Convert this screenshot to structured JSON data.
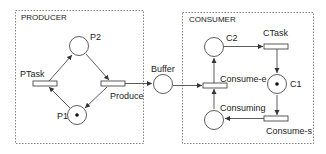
{
  "diagram": {
    "type": "petri-net",
    "groups": [
      {
        "id": "producer",
        "label": "PRODUCER"
      },
      {
        "id": "consumer",
        "label": "CONSUMER"
      }
    ],
    "places": [
      {
        "id": "P2",
        "label": "P2",
        "tokens": 0
      },
      {
        "id": "P1",
        "label": "P1",
        "tokens": 1
      },
      {
        "id": "Buffer",
        "label": "Buffer",
        "tokens": 0
      },
      {
        "id": "C2",
        "label": "C2",
        "tokens": 0
      },
      {
        "id": "C1",
        "label": "C1",
        "tokens": 1
      },
      {
        "id": "Consuming",
        "label": "Consuming",
        "tokens": 0
      }
    ],
    "transitions": [
      {
        "id": "PTask",
        "label": "PTask"
      },
      {
        "id": "Produce",
        "label": "Produce"
      },
      {
        "id": "Consume-e",
        "label": "Consume-e"
      },
      {
        "id": "CTask",
        "label": "CTask"
      },
      {
        "id": "Consume-s",
        "label": "Consume-s"
      }
    ],
    "arcs": [
      [
        "PTask",
        "P2"
      ],
      [
        "P2",
        "Produce"
      ],
      [
        "Produce",
        "P1"
      ],
      [
        "P1",
        "PTask"
      ],
      [
        "Produce",
        "Buffer"
      ],
      [
        "Buffer",
        "Consume-e"
      ],
      [
        "Consume-e",
        "C2"
      ],
      [
        "C2",
        "CTask"
      ],
      [
        "CTask",
        "C1"
      ],
      [
        "C1",
        "Consume-s"
      ],
      [
        "Consume-s",
        "Consuming"
      ],
      [
        "Consuming",
        "Consume-e"
      ]
    ]
  },
  "labels": {
    "producer": "PRODUCER",
    "consumer": "CONSUMER",
    "p2": "P2",
    "p1": "P1",
    "ptask": "PTask",
    "produce": "Produce",
    "buffer": "Buffer",
    "c2": "C2",
    "c1": "C1",
    "ctask": "CTask",
    "consume_e": "Consume-e",
    "consuming": "Consuming",
    "consume_s": "Consume-s"
  }
}
